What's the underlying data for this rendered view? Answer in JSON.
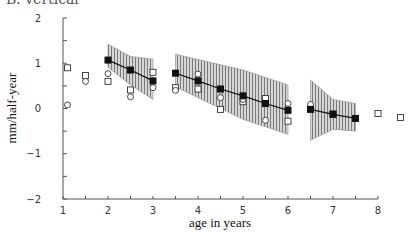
{
  "title": "B. vertical",
  "chart_data": {
    "type": "scatter",
    "title": "B. vertical",
    "xlabel": "age in years",
    "ylabel": "mm/half-year",
    "xlim": [
      1,
      8
    ],
    "ylim": [
      -2,
      2
    ],
    "xticks": [
      1,
      2,
      3,
      4,
      5,
      6,
      7,
      8
    ],
    "yticks": [
      -2,
      -1,
      0,
      1,
      2
    ],
    "grid": false,
    "legend": null,
    "series": [
      {
        "name": "mean (filled squares, line)",
        "marker": "filled-square",
        "segments": [
          {
            "x": [
              2.0,
              2.5,
              3.0
            ],
            "y": [
              1.07,
              0.85,
              0.61
            ]
          },
          {
            "x": [
              3.5,
              4.0,
              4.5,
              5.0,
              5.5,
              6.0
            ],
            "y": [
              0.78,
              0.61,
              0.43,
              0.28,
              0.11,
              -0.04
            ]
          },
          {
            "x": [
              6.5,
              7.0,
              7.5
            ],
            "y": [
              -0.02,
              -0.13,
              -0.22
            ]
          }
        ]
      },
      {
        "name": "confidence band (hatched)",
        "type": "band",
        "segments": [
          {
            "x": [
              2.0,
              2.5,
              3.0
            ],
            "upper": [
              1.42,
              1.15,
              1.09
            ],
            "lower": [
              0.91,
              0.52,
              0.2
            ]
          },
          {
            "x": [
              3.5,
              5.0,
              6.0
            ],
            "upper": [
              1.2,
              0.85,
              0.52
            ],
            "lower": [
              0.48,
              -0.24,
              -0.57
            ]
          },
          {
            "x": [
              6.5,
              7.0,
              7.5
            ],
            "upper": [
              0.63,
              0.2,
              0.11
            ],
            "lower": [
              -0.7,
              -0.46,
              -0.5
            ]
          }
        ]
      },
      {
        "name": "observations (open squares)",
        "marker": "open-square",
        "x": [
          1.1,
          1.5,
          2.0,
          2.5,
          3.0,
          3.5,
          4.0,
          4.5,
          5.0,
          5.5,
          6.0,
          7.0,
          8.0,
          8.5
        ],
        "y": [
          0.9,
          0.73,
          0.6,
          0.41,
          0.8,
          0.46,
          0.43,
          -0.02,
          0.15,
          0.22,
          -0.28,
          -0.12,
          -0.11,
          -0.2
        ]
      },
      {
        "name": "observations (open circles)",
        "marker": "open-circle",
        "x": [
          1.1,
          1.5,
          2.0,
          2.5,
          3.0,
          3.5,
          4.0,
          4.5,
          5.0,
          5.5,
          6.0,
          6.5
        ],
        "y": [
          0.08,
          0.6,
          0.77,
          0.26,
          0.46,
          0.4,
          0.76,
          0.24,
          0.2,
          -0.26,
          0.11,
          0.09
        ]
      }
    ]
  },
  "plot": {
    "left": 63,
    "right": 378,
    "top": 18,
    "bottom": 199,
    "colors": {
      "axis": "#555555",
      "line": "#111111",
      "band_fill": "#bdbdbd",
      "hatch": "#777777",
      "marker": "#333333"
    }
  }
}
